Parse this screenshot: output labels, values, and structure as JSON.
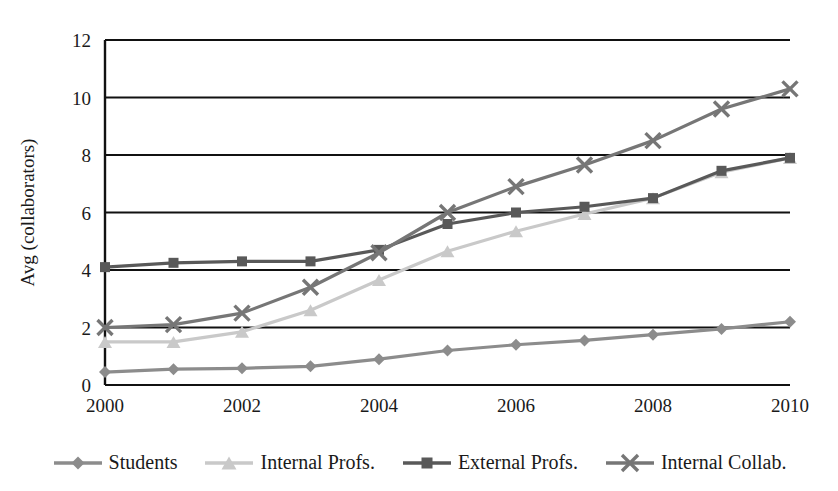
{
  "chart_data": {
    "type": "line",
    "title": "",
    "xlabel": "",
    "ylabel": "Avg (collaborators)",
    "x": [
      2000,
      2001,
      2002,
      2003,
      2004,
      2005,
      2006,
      2007,
      2008,
      2009,
      2010
    ],
    "xtick_labels": [
      "2000",
      "2002",
      "2004",
      "2006",
      "2008",
      "2010"
    ],
    "xticks": [
      2000,
      2002,
      2004,
      2006,
      2008,
      2010
    ],
    "ytick_labels": [
      "0",
      "2",
      "4",
      "6",
      "8",
      "10",
      "12"
    ],
    "yticks": [
      0,
      2,
      4,
      6,
      8,
      10,
      12
    ],
    "ylim": [
      0,
      12
    ],
    "xlim": [
      2000,
      2010
    ],
    "grid": "horizontal",
    "legend_position": "bottom",
    "series": [
      {
        "name": "Students",
        "marker": "diamond",
        "color": "#8c8c8c",
        "values": [
          0.45,
          0.55,
          0.58,
          0.65,
          0.9,
          1.2,
          1.4,
          1.55,
          1.75,
          1.95,
          2.2
        ]
      },
      {
        "name": "Internal Profs.",
        "marker": "triangle",
        "color": "#c9c9c9",
        "values": [
          1.5,
          1.5,
          1.85,
          2.6,
          3.65,
          4.65,
          5.35,
          5.95,
          6.5,
          7.4,
          7.9
        ]
      },
      {
        "name": "External Profs.",
        "marker": "square",
        "color": "#595959",
        "values": [
          4.1,
          4.25,
          4.3,
          4.3,
          4.7,
          5.6,
          6.0,
          6.2,
          6.5,
          7.45,
          7.9
        ]
      },
      {
        "name": "Internal Collab.",
        "marker": "cross-x",
        "color": "#767676",
        "values": [
          2.0,
          2.1,
          2.5,
          3.4,
          4.6,
          6.0,
          6.9,
          7.65,
          8.5,
          9.6,
          10.3
        ]
      }
    ]
  },
  "legend": {
    "items": [
      {
        "label": "Students",
        "marker": "diamond",
        "color": "#8c8c8c"
      },
      {
        "label": "Internal Profs.",
        "marker": "triangle",
        "color": "#c9c9c9"
      },
      {
        "label": "External Profs.",
        "marker": "square",
        "color": "#595959"
      },
      {
        "label": "Internal Collab.",
        "marker": "cross-x",
        "color": "#767676"
      }
    ]
  },
  "axes": {
    "y_axis_title": "Avg (collaborators)"
  }
}
